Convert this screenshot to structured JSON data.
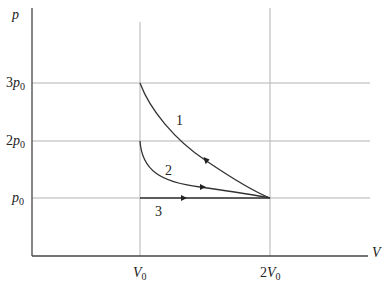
{
  "diagram": {
    "type": "p-V diagram",
    "axes": {
      "y_label": "p",
      "x_label": "V"
    },
    "y_ticks": [
      {
        "coef": "3",
        "sym": "p",
        "sub": "0",
        "value": 3
      },
      {
        "coef": "2",
        "sym": "p",
        "sub": "0",
        "value": 2
      },
      {
        "coef": "",
        "sym": "p",
        "sub": "0",
        "value": 1
      }
    ],
    "x_ticks": [
      {
        "coef": "",
        "sym": "V",
        "sub": "0",
        "value": 1
      },
      {
        "coef": "2",
        "sym": "V",
        "sub": "0",
        "value": 2
      }
    ],
    "processes": [
      {
        "label": "1",
        "from": [
          1,
          3
        ],
        "to": [
          2,
          1
        ],
        "shape": "curve",
        "direction": "toward 2V0"
      },
      {
        "label": "2",
        "from": [
          1,
          2
        ],
        "to": [
          2,
          1
        ],
        "shape": "curve",
        "direction": "toward 2V0"
      },
      {
        "label": "3",
        "from": [
          1,
          1
        ],
        "to": [
          2,
          1
        ],
        "shape": "isobaric line",
        "direction": "toward 2V0"
      }
    ],
    "colors": {
      "axis": "#444444",
      "grid": "#aaaaaa",
      "curve": "#333333"
    }
  }
}
